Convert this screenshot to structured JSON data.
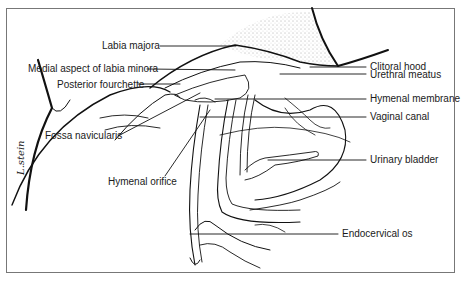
{
  "figure": {
    "type": "anatomical line drawing",
    "artist_signature": "L.stein"
  },
  "labels": {
    "left": [
      {
        "text": "Labia majora"
      },
      {
        "text": "Medial aspect of labia minora"
      },
      {
        "text": "Posterior fourchette"
      },
      {
        "text": "Fossa navicularis"
      },
      {
        "text": "Hymenal orifice"
      }
    ],
    "right": [
      {
        "text": "Clitoral hood"
      },
      {
        "text": "Urethral meatus"
      },
      {
        "text": "Hymenal membrane"
      },
      {
        "text": "Vaginal canal"
      },
      {
        "text": "Urinary bladder"
      },
      {
        "text": "Endocervical os"
      }
    ]
  },
  "colors": {
    "line": "#111111",
    "frame": "#777777",
    "background": "#ffffff"
  }
}
